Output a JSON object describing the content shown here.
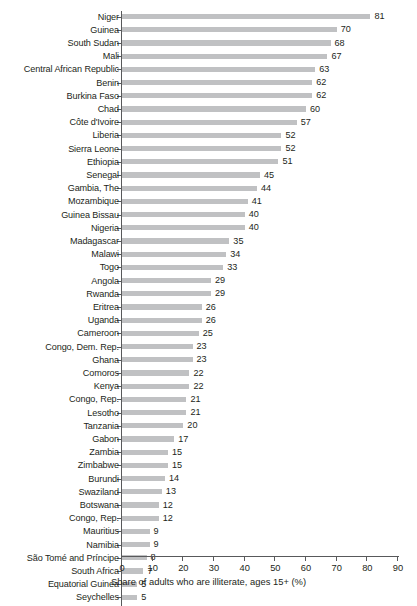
{
  "chart_data": {
    "type": "bar",
    "orientation": "horizontal",
    "title": "",
    "xlabel": "Share of adults who are illiterate, ages 15+ (%)",
    "ylabel": "",
    "xlim": [
      0,
      90
    ],
    "xticks": [
      0,
      10,
      20,
      30,
      40,
      50,
      60,
      70,
      80,
      90
    ],
    "grid": false,
    "legend": false,
    "bar_color": "#c0c1c3",
    "text_color": "#231f20",
    "axis_color": "#58595b",
    "categories": [
      "Niger",
      "Guinea",
      "South Sudan",
      "Mali",
      "Central African Republic",
      "Benin",
      "Burkina Faso",
      "Chad",
      "Côte d'Ivoire",
      "Liberia",
      "Sierra Leone",
      "Ethiopia",
      "Senegal",
      "Gambia, The",
      "Mozambique",
      "Guinea Bissau",
      "Nigeria",
      "Madagascar",
      "Malawi",
      "Togo",
      "Angola",
      "Rwanda",
      "Eritrea",
      "Uganda",
      "Cameroon",
      "Congo, Dem. Rep.",
      "Ghana",
      "Comoros",
      "Kenya",
      "Congo, Rep.",
      "Lesotho",
      "Tanzania",
      "Gabon",
      "Zambia",
      "Zimbabwe",
      "Burundi",
      "Swaziland",
      "Botswana",
      "Congo, Rep.",
      "Mauritius",
      "Namibia",
      "São Tomé and Príncipe",
      "South Africa",
      "Equatorial Guinea",
      "Seychelles"
    ],
    "values": [
      81,
      70,
      68,
      67,
      63,
      62,
      62,
      60,
      57,
      52,
      52,
      51,
      45,
      44,
      41,
      40,
      40,
      35,
      34,
      33,
      29,
      29,
      26,
      26,
      25,
      23,
      23,
      22,
      22,
      21,
      21,
      20,
      17,
      15,
      15,
      14,
      13,
      12,
      12,
      9,
      9,
      8,
      7,
      5,
      5
    ]
  }
}
